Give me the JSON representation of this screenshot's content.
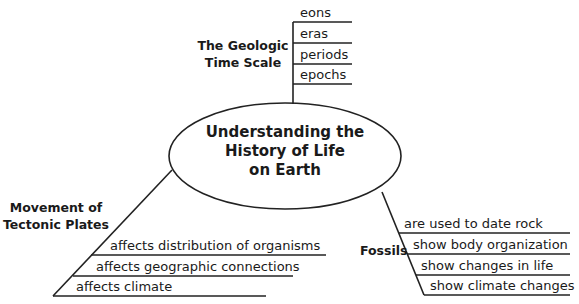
{
  "central_topic": {
    "lines": [
      "Understanding the",
      "History of Life",
      "on Earth"
    ]
  },
  "branches": {
    "geologic_time_scale": {
      "title_lines": [
        "The Geologic",
        "Time Scale"
      ],
      "items": [
        "eons",
        "eras",
        "periods",
        "epochs"
      ]
    },
    "tectonic_plates": {
      "title_lines": [
        "Movement of",
        "Tectonic Plates"
      ],
      "items": [
        "affects distribution of organisms",
        "affects geographic connections",
        "affects climate"
      ]
    },
    "fossils": {
      "title": "Fossils",
      "items": [
        "are used to date rock",
        "show body organization",
        "show changes in life",
        "show climate changes"
      ]
    }
  },
  "colors": {
    "line": "#222222",
    "text": "#1a1a1a",
    "background": "#ffffff"
  }
}
